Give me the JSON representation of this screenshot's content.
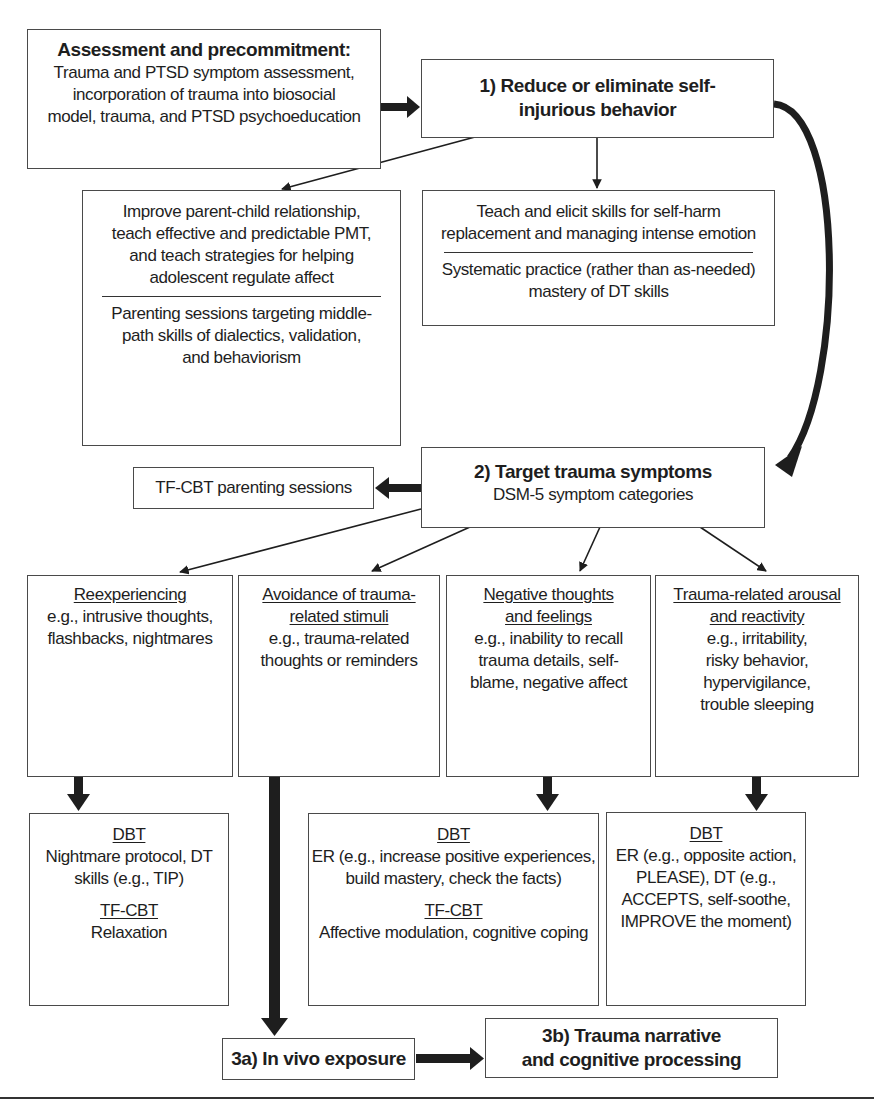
{
  "assessment": {
    "title": "Assessment and precommitment:",
    "lines": [
      "Trauma and PTSD symptom assessment,",
      "incorporation of trauma into biosocial",
      "model, trauma, and PTSD psychoeducation"
    ]
  },
  "step1": {
    "lines": [
      "1) Reduce or eliminate self-",
      "injurious behavior"
    ]
  },
  "parent_box": {
    "top_lines": [
      "Improve parent-child relationship,",
      "teach effective and predictable PMT,",
      "and teach strategies for helping",
      "adolescent regulate affect"
    ],
    "bottom_lines": [
      "Parenting sessions targeting middle-",
      "path skills of dialectics, validation,",
      "and behaviorism"
    ]
  },
  "skills_box": {
    "top_lines": [
      "Teach and elicit skills for self-harm",
      "replacement and managing intense emotion"
    ],
    "bottom_lines": [
      "Systematic practice (rather than as-needed)",
      "mastery of DT skills"
    ]
  },
  "tfcbt_parenting": {
    "label": "TF-CBT parenting sessions"
  },
  "step2": {
    "title": "2) Target trauma symptoms",
    "subtitle": "DSM-5 symptom categories"
  },
  "symptoms": [
    {
      "heading": [
        "Reexperiencing"
      ],
      "lines": [
        "e.g., intrusive thoughts,",
        "flashbacks, nightmares"
      ]
    },
    {
      "heading": [
        "Avoidance of trauma-",
        "related stimuli"
      ],
      "lines": [
        "e.g., trauma-related",
        "thoughts or reminders"
      ]
    },
    {
      "heading": [
        "Negative thoughts",
        "and feelings"
      ],
      "lines": [
        "e.g., inability to recall",
        "trauma details, self-",
        "blame, negative affect"
      ]
    },
    {
      "heading": [
        "Trauma-related arousal",
        "and reactivity"
      ],
      "lines": [
        "e.g., irritability,",
        "risky behavior,",
        "hypervigilance,",
        "trouble sleeping"
      ]
    }
  ],
  "treatments": [
    {
      "h1": "DBT",
      "l1": [
        "Nightmare protocol, DT",
        "skills (e.g., TIP)"
      ],
      "h2": "TF-CBT",
      "l2": [
        "Relaxation"
      ]
    },
    {
      "h1": "DBT",
      "l1": [
        "ER (e.g., increase positive experiences,",
        "build mastery, check the facts)"
      ],
      "h2": "TF-CBT",
      "l2": [
        "Affective modulation, cognitive coping"
      ]
    },
    {
      "h1": "DBT",
      "l1": [
        "ER (e.g., opposite action,",
        "PLEASE), DT (e.g.,",
        "ACCEPTS, self-soothe,",
        "IMPROVE the moment)"
      ]
    }
  ],
  "step3a": {
    "label": "3a) In vivo exposure"
  },
  "step3b": {
    "lines": [
      "3b) Trauma narrative",
      "and cognitive processing"
    ]
  },
  "colors": {
    "line": "#1e1e1e",
    "border": "#4a4a4a",
    "background": "#ffffff"
  }
}
